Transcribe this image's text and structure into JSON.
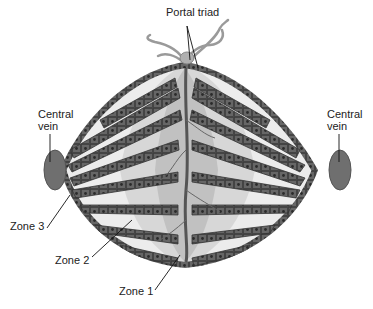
{
  "diagram": {
    "labels": {
      "portal_triad": "Portal triad",
      "central_vein_left_line1": "Central",
      "central_vein_left_line2": "vein",
      "central_vein_right_line1": "Central",
      "central_vein_right_line2": "vein",
      "zone3": "Zone 3",
      "zone2": "Zone 2",
      "zone1": "Zone 1"
    },
    "colors": {
      "background": "#ffffff",
      "sinusoid": "#ececec",
      "hepatocyte_plate": "#5a5a5a",
      "cell_border": "#3a3a3a",
      "nucleus": "#2a2a2a",
      "zone_shade": "#bdbdbd",
      "vein": "#6f6f6f",
      "vessel": "#9a9a9a"
    }
  }
}
